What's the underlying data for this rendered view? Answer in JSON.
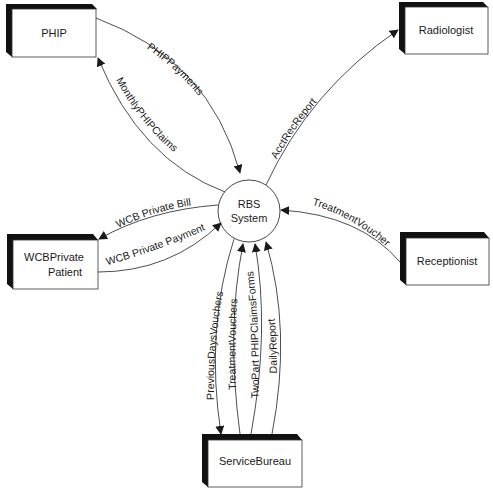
{
  "diagram": {
    "type": "context-diagram",
    "process": {
      "line1": "RBS",
      "line2": "System"
    },
    "entities": {
      "phip": "PHIP",
      "radiologist": "Radiologist",
      "wcb_line1": "WCBPrivate",
      "wcb_line2": "Patient",
      "receptionist": "Receptionist",
      "service_bureau": "ServiceBureau"
    },
    "flows": {
      "phip_payments": "PHIPPayments",
      "monthly_phip_claims": "MonthlyPHIPClaims",
      "acct_rec_report": "AcctRecReport",
      "wcb_private_bill": "WCB Private Bill",
      "wcb_private_payment": "WCB Private Payment",
      "treatment_voucher": "TreatmentVoucher",
      "previous_days_vouchers": "PreviousDaysVouchers",
      "treatment_vouchers": "TreatmentVouchers",
      "two_part_phip_claims_forms": "TwoPart PHIPClaimsForms",
      "daily_report": "DailyReport"
    },
    "colors": {
      "line": "#3a3a3a",
      "shadow": "#111111",
      "box_fill": "#ffffff"
    }
  }
}
